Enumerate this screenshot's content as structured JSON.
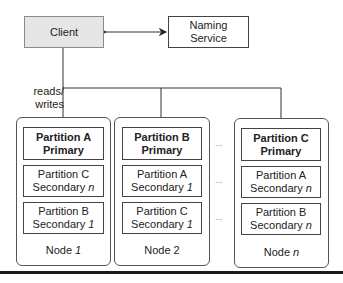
{
  "client": {
    "label": "Client"
  },
  "naming_service": {
    "line1": "Naming",
    "line2": "Service"
  },
  "edge_label": {
    "line1": "reads/",
    "line2": "writes"
  },
  "nodes": [
    {
      "label": "Node",
      "index": "1",
      "replicas": [
        {
          "line1": "Partition A",
          "line2": "Primary",
          "role": "primary"
        },
        {
          "line1": "Partition C",
          "line2": "Secondary",
          "index": "n",
          "role": "secondary"
        },
        {
          "line1": "Partition B",
          "line2": "Secondary",
          "index": "1",
          "role": "secondary"
        }
      ]
    },
    {
      "label": "Node",
      "index": "2",
      "replicas": [
        {
          "line1": "Partition B",
          "line2": "Primary",
          "role": "primary"
        },
        {
          "line1": "Partition A",
          "line2": "Secondary",
          "index": "1",
          "role": "secondary"
        },
        {
          "line1": "Partition C",
          "line2": "Secondary",
          "index": "1",
          "role": "secondary"
        }
      ]
    },
    {
      "label": "Node",
      "index": "n",
      "replicas": [
        {
          "line1": "Partition C",
          "line2": "Primary",
          "role": "primary"
        },
        {
          "line1": "Partition A",
          "line2": "Secondary",
          "index": "n",
          "role": "secondary"
        },
        {
          "line1": "Partition B",
          "line2": "Secondary",
          "index": "n",
          "role": "secondary"
        }
      ]
    }
  ],
  "ellipsis": "...",
  "colors": {
    "client_fill": "#e6e6e6",
    "stroke": "#444444",
    "bar": "#1a1a1a"
  }
}
